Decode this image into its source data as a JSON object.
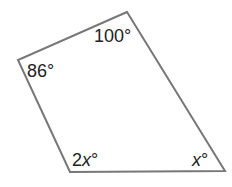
{
  "diagram": {
    "type": "quadrilateral",
    "stroke_color": "#777777",
    "vertices": {
      "top": [
        127,
        12
      ],
      "left": [
        18,
        60
      ],
      "bottom_left": [
        70,
        172
      ],
      "bottom_right": [
        225,
        171
      ]
    },
    "angles": {
      "top": {
        "num": "100",
        "var": "",
        "deg": "°"
      },
      "left": {
        "num": "86",
        "var": "",
        "deg": "°"
      },
      "bottom_left": {
        "num": "2",
        "var": "x",
        "deg": "°"
      },
      "bottom_right": {
        "num": "",
        "var": "x",
        "deg": "°"
      }
    }
  }
}
